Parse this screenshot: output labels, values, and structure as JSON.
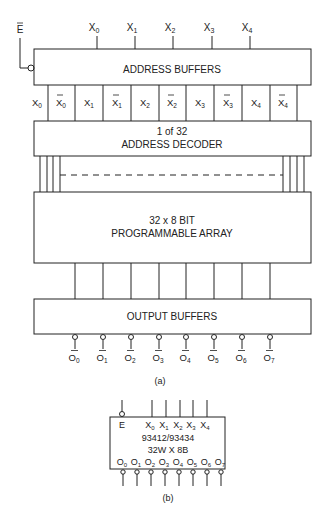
{
  "figure_a": {
    "enable_label": "E",
    "inputs": [
      "X",
      "X",
      "X",
      "X",
      "X"
    ],
    "input_subs": [
      "0",
      "1",
      "2",
      "3",
      "4"
    ],
    "address_buffers": "ADDRESS BUFFERS",
    "buffer_outputs": [
      {
        "t": "X",
        "s": "0",
        "bar": false
      },
      {
        "t": "X",
        "s": "0",
        "bar": true
      },
      {
        "t": "X",
        "s": "1",
        "bar": false
      },
      {
        "t": "X",
        "s": "1",
        "bar": true
      },
      {
        "t": "X",
        "s": "2",
        "bar": false
      },
      {
        "t": "X",
        "s": "2",
        "bar": true
      },
      {
        "t": "X",
        "s": "3",
        "bar": false
      },
      {
        "t": "X",
        "s": "3",
        "bar": true
      },
      {
        "t": "X",
        "s": "4",
        "bar": false
      },
      {
        "t": "X",
        "s": "4",
        "bar": true
      }
    ],
    "decoder_line1": "1 of 32",
    "decoder_line2": "ADDRESS DECODER",
    "array_line1": "32 x 8 BIT",
    "array_line2": "PROGRAMMABLE ARRAY",
    "output_buffers": "OUTPUT BUFFERS",
    "outputs": [
      "0",
      "1",
      "2",
      "3",
      "4",
      "5",
      "6",
      "7"
    ],
    "output_letter": "O",
    "caption": "(a)"
  },
  "figure_b": {
    "enable_label": "E",
    "inputs_text": "X",
    "input_subs": [
      "0",
      "1",
      "2",
      "3",
      "4"
    ],
    "part_number": "93412/93434",
    "organization": "32W X 8B",
    "output_letter": "O",
    "output_subs": [
      "0",
      "1",
      "2",
      "3",
      "4",
      "5",
      "6",
      "7"
    ],
    "caption": "(b)"
  }
}
